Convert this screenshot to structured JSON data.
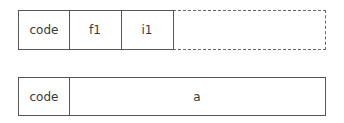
{
  "diagram": {
    "rows": [
      {
        "cells": [
          {
            "label": "code"
          },
          {
            "label": "f1"
          },
          {
            "label": "i1"
          },
          {
            "label": "",
            "style": "dashed"
          }
        ]
      },
      {
        "cells": [
          {
            "label": "code"
          },
          {
            "label": "a"
          }
        ]
      }
    ]
  }
}
